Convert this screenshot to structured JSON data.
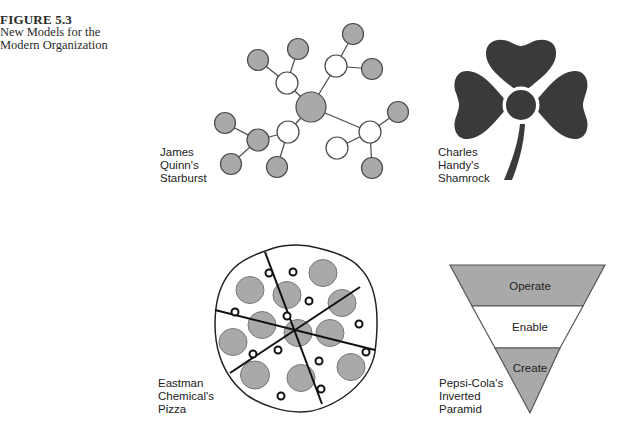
{
  "figure": {
    "number": "FIGURE 5.3",
    "title_line1": "New Models for the",
    "title_line2": "Modern Organization"
  },
  "colors": {
    "node_gray": "#a9a9a9",
    "outline": "#4a4a4a",
    "shamrock": "#3a3a3a",
    "pyramid_gray": "#a9a9a9"
  },
  "models": {
    "starburst": {
      "label_lines": [
        "James",
        "Quinn's",
        "Starburst"
      ]
    },
    "shamrock": {
      "label_lines": [
        "Charles",
        "Handy's",
        "Shamrock"
      ]
    },
    "pizza": {
      "label_lines": [
        "Eastman",
        "Chemical's",
        "Pizza"
      ]
    },
    "pyramid": {
      "label_lines": [
        "Pepsi-Cola's",
        "Inverted",
        "Paramid"
      ],
      "tiers": [
        "Operate",
        "Enable",
        "Create"
      ]
    }
  }
}
